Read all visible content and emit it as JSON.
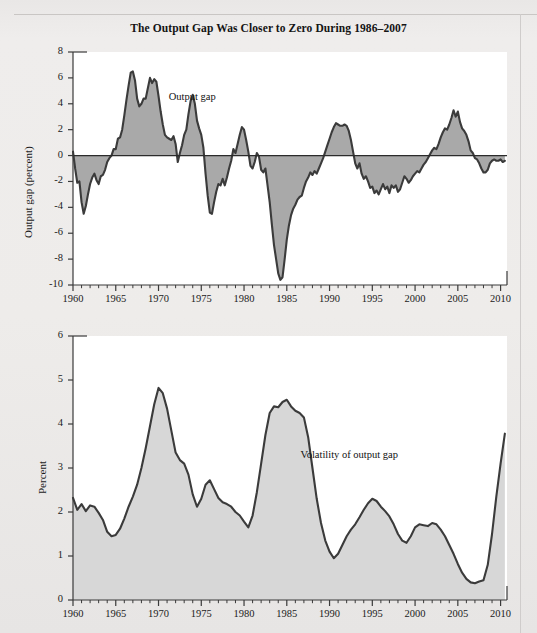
{
  "figure": {
    "title": "The Output Gap Was Closer to Zero During 1986–2007",
    "background_color": "#eceaea",
    "line_color": "#3b3b3b",
    "top_fill_color": "#a9a9a9",
    "bottom_fill_color": "#d7d7d7"
  },
  "chart_data": [
    {
      "type": "area",
      "panel": "top",
      "title": "The Output Gap Was Closer to Zero During 1986–2007",
      "xlabel": "",
      "ylabel": "Output gap (percent)",
      "xlim": [
        1960,
        2010.75
      ],
      "ylim": [
        -10,
        8
      ],
      "ytick_labels": [
        "8",
        "6",
        "4",
        "2",
        "0",
        "-2",
        "-4",
        "-6",
        "-8",
        "-10"
      ],
      "ytick_values": [
        8,
        6,
        4,
        2,
        0,
        -2,
        -4,
        -6,
        -8,
        -10
      ],
      "xtick_labels": [
        "1960",
        "1965",
        "1970",
        "1975",
        "1980",
        "1985",
        "1990",
        "1995",
        "2000",
        "2005",
        "2010"
      ],
      "xtick_values": [
        1960,
        1965,
        1970,
        1975,
        1980,
        1985,
        1990,
        1995,
        2000,
        2005,
        2010
      ],
      "minor_xtick_interval": 1,
      "grid": false,
      "legend": "none",
      "annotations": [
        {
          "text": "Output gap",
          "x": 1971.2,
          "y": 4.4
        }
      ],
      "zero_line": true,
      "series": [
        {
          "name": "Output gap",
          "x": [
            1960.0,
            1960.25,
            1960.5,
            1960.75,
            1961.0,
            1961.25,
            1961.5,
            1961.75,
            1962.0,
            1962.25,
            1962.5,
            1962.75,
            1963.0,
            1963.25,
            1963.5,
            1963.75,
            1964.0,
            1964.25,
            1964.5,
            1964.75,
            1965.0,
            1965.25,
            1965.5,
            1965.75,
            1966.0,
            1966.25,
            1966.5,
            1966.75,
            1967.0,
            1967.25,
            1967.5,
            1967.75,
            1968.0,
            1968.25,
            1968.5,
            1968.75,
            1969.0,
            1969.25,
            1969.5,
            1969.75,
            1970.0,
            1970.25,
            1970.5,
            1970.75,
            1971.0,
            1971.25,
            1971.5,
            1971.75,
            1972.0,
            1972.25,
            1972.5,
            1972.75,
            1973.0,
            1973.25,
            1973.5,
            1973.75,
            1974.0,
            1974.25,
            1974.5,
            1974.75,
            1975.0,
            1975.25,
            1975.5,
            1975.75,
            1976.0,
            1976.25,
            1976.5,
            1976.75,
            1977.0,
            1977.25,
            1977.5,
            1977.75,
            1978.0,
            1978.25,
            1978.5,
            1978.75,
            1979.0,
            1979.25,
            1979.5,
            1979.75,
            1980.0,
            1980.25,
            1980.5,
            1980.75,
            1981.0,
            1981.25,
            1981.5,
            1981.75,
            1982.0,
            1982.25,
            1982.5,
            1982.75,
            1983.0,
            1983.25,
            1983.5,
            1983.75,
            1984.0,
            1984.25,
            1984.5,
            1984.75,
            1985.0,
            1985.25,
            1985.5,
            1985.75,
            1986.0,
            1986.25,
            1986.5,
            1986.75,
            1987.0,
            1987.25,
            1987.5,
            1987.75,
            1988.0,
            1988.25,
            1988.5,
            1988.75,
            1989.0,
            1989.25,
            1989.5,
            1989.75,
            1990.0,
            1990.25,
            1990.5,
            1990.75,
            1991.0,
            1991.25,
            1991.5,
            1991.75,
            1992.0,
            1992.25,
            1992.5,
            1992.75,
            1993.0,
            1993.25,
            1993.5,
            1993.75,
            1994.0,
            1994.25,
            1994.5,
            1994.75,
            1995.0,
            1995.25,
            1995.5,
            1995.75,
            1996.0,
            1996.25,
            1996.5,
            1996.75,
            1997.0,
            1997.25,
            1997.5,
            1997.75,
            1998.0,
            1998.25,
            1998.5,
            1998.75,
            1999.0,
            1999.25,
            1999.5,
            1999.75,
            2000.0,
            2000.25,
            2000.5,
            2000.75,
            2001.0,
            2001.25,
            2001.5,
            2001.75,
            2002.0,
            2002.25,
            2002.5,
            2002.75,
            2003.0,
            2003.25,
            2003.5,
            2003.75,
            2004.0,
            2004.25,
            2004.5,
            2004.75,
            2005.0,
            2005.25,
            2005.5,
            2005.75,
            2006.0,
            2006.25,
            2006.5,
            2006.75,
            2007.0,
            2007.25,
            2007.5,
            2007.75,
            2008.0,
            2008.25,
            2008.5,
            2008.75,
            2009.0,
            2009.25,
            2009.5,
            2009.75,
            2010.0,
            2010.25,
            2010.5
          ],
          "y": [
            0.3,
            -1.0,
            -2.1,
            -2.0,
            -3.6,
            -4.5,
            -3.9,
            -3.0,
            -2.2,
            -1.7,
            -1.4,
            -1.9,
            -2.2,
            -1.6,
            -1.5,
            -1.1,
            -0.5,
            -0.2,
            0.0,
            0.5,
            0.5,
            1.3,
            1.4,
            2.0,
            3.1,
            4.3,
            5.4,
            6.4,
            6.5,
            5.8,
            4.4,
            3.8,
            4.0,
            4.4,
            4.4,
            5.2,
            6.0,
            5.6,
            5.9,
            5.7,
            4.6,
            3.4,
            2.4,
            1.6,
            1.4,
            1.3,
            1.2,
            1.5,
            0.9,
            -0.5,
            0.2,
            0.8,
            1.6,
            2.0,
            3.2,
            4.2,
            4.7,
            4.0,
            2.7,
            2.1,
            1.6,
            0.6,
            -1.4,
            -3.1,
            -4.4,
            -4.5,
            -3.6,
            -2.8,
            -2.2,
            -2.3,
            -1.8,
            -2.3,
            -1.7,
            -1.0,
            -0.4,
            0.5,
            0.2,
            0.9,
            1.6,
            2.2,
            2.0,
            1.2,
            0.3,
            -0.8,
            -1.0,
            -0.5,
            0.2,
            -0.1,
            -1.1,
            -1.3,
            -1.0,
            -2.3,
            -3.6,
            -5.3,
            -6.9,
            -8.0,
            -9.1,
            -9.6,
            -9.4,
            -8.0,
            -6.5,
            -5.4,
            -4.6,
            -4.1,
            -3.8,
            -3.4,
            -3.2,
            -3.1,
            -2.5,
            -2.0,
            -1.7,
            -1.3,
            -1.5,
            -1.2,
            -1.4,
            -1.0,
            -0.6,
            -0.2,
            0.3,
            0.8,
            1.3,
            1.8,
            2.2,
            2.5,
            2.4,
            2.3,
            2.3,
            2.4,
            2.3,
            1.9,
            1.2,
            0.3,
            -0.6,
            -1.0,
            -0.6,
            -1.4,
            -1.8,
            -1.6,
            -2.0,
            -2.5,
            -2.4,
            -2.9,
            -2.7,
            -3.0,
            -2.6,
            -2.2,
            -2.6,
            -2.4,
            -2.9,
            -2.3,
            -2.5,
            -2.3,
            -2.8,
            -2.6,
            -2.1,
            -1.6,
            -1.8,
            -2.1,
            -1.9,
            -1.6,
            -1.4,
            -1.2,
            -1.3,
            -1.0,
            -0.7,
            -0.5,
            -0.2,
            0.1,
            0.4,
            0.6,
            0.5,
            0.9,
            1.4,
            1.8,
            2.1,
            2.0,
            2.4,
            2.9,
            3.5,
            3.0,
            3.4,
            2.6,
            2.1,
            1.9,
            1.6,
            1.1,
            0.4,
            0.2,
            -0.2,
            -0.3,
            -0.6,
            -1.0,
            -1.3,
            -1.3,
            -1.1,
            -0.6,
            -0.4,
            -0.3,
            -0.4,
            -0.4,
            -0.3,
            -0.5,
            -0.4,
            -0.3,
            0.1,
            0.4,
            0.0,
            0.3,
            0.8,
            0.5,
            0.1,
            -0.1,
            -0.2,
            -0.2,
            -0.3,
            -0.4,
            -0.5,
            -0.5,
            -0.5,
            -0.4,
            -0.6,
            -1.6,
            -3.8,
            -6.2,
            -8.2,
            -9.3,
            -9.7,
            -9.2,
            -9.6,
            -8.4,
            -7.9,
            -8.1
          ]
        }
      ]
    },
    {
      "type": "area",
      "panel": "bottom",
      "title": "",
      "xlabel": "",
      "ylabel": "Percent",
      "xlim": [
        1960,
        2010.75
      ],
      "ylim": [
        0,
        6
      ],
      "ytick_labels": [
        "6",
        "5",
        "4",
        "3",
        "2",
        "1",
        "0"
      ],
      "ytick_values": [
        6,
        5,
        4,
        3,
        2,
        1,
        0
      ],
      "xtick_labels": [
        "1960",
        "1965",
        "1970",
        "1975",
        "1980",
        "1985",
        "1990",
        "1995",
        "2000",
        "2005",
        "2010"
      ],
      "xtick_values": [
        1960,
        1965,
        1970,
        1975,
        1980,
        1985,
        1990,
        1995,
        2000,
        2005,
        2010
      ],
      "minor_xtick_interval": 1,
      "grid": false,
      "legend": "none",
      "annotations": [
        {
          "text": "Volatility of output gap",
          "x": 1986.6,
          "y": 3.25
        }
      ],
      "zero_line": false,
      "series": [
        {
          "name": "Volatility of output gap",
          "x": [
            1960.0,
            1960.5,
            1961.0,
            1961.5,
            1962.0,
            1962.5,
            1963.0,
            1963.5,
            1964.0,
            1964.5,
            1965.0,
            1965.5,
            1966.0,
            1966.5,
            1967.0,
            1967.5,
            1968.0,
            1968.5,
            1969.0,
            1969.5,
            1970.0,
            1970.5,
            1971.0,
            1971.5,
            1972.0,
            1972.5,
            1973.0,
            1973.5,
            1974.0,
            1974.5,
            1975.0,
            1975.5,
            1976.0,
            1976.5,
            1977.0,
            1977.5,
            1978.0,
            1978.5,
            1979.0,
            1979.5,
            1980.0,
            1980.5,
            1981.0,
            1981.5,
            1982.0,
            1982.5,
            1983.0,
            1983.5,
            1984.0,
            1984.5,
            1985.0,
            1985.5,
            1986.0,
            1986.5,
            1987.0,
            1987.5,
            1988.0,
            1988.5,
            1989.0,
            1989.5,
            1990.0,
            1990.5,
            1991.0,
            1991.5,
            1992.0,
            1992.5,
            1993.0,
            1993.5,
            1994.0,
            1994.5,
            1995.0,
            1995.5,
            1996.0,
            1996.5,
            1997.0,
            1997.5,
            1998.0,
            1998.5,
            1999.0,
            1999.5,
            2000.0,
            2000.5,
            2001.0,
            2001.5,
            2002.0,
            2002.5,
            2003.0,
            2003.5,
            2004.0,
            2004.5,
            2005.0,
            2005.5,
            2006.0,
            2006.5,
            2007.0,
            2007.5,
            2008.0,
            2008.5,
            2009.0,
            2009.5,
            2010.0,
            2010.5
          ],
          "y": [
            2.32,
            2.05,
            2.18,
            2.02,
            2.15,
            2.12,
            1.98,
            1.82,
            1.55,
            1.45,
            1.48,
            1.62,
            1.85,
            2.12,
            2.35,
            2.62,
            3.0,
            3.45,
            3.95,
            4.45,
            4.82,
            4.7,
            4.35,
            3.85,
            3.35,
            3.18,
            3.1,
            2.85,
            2.4,
            2.12,
            2.3,
            2.62,
            2.72,
            2.52,
            2.32,
            2.22,
            2.18,
            2.12,
            2.0,
            1.92,
            1.78,
            1.65,
            1.92,
            2.45,
            3.1,
            3.75,
            4.25,
            4.4,
            4.38,
            4.5,
            4.55,
            4.4,
            4.3,
            4.25,
            4.15,
            3.7,
            3.0,
            2.3,
            1.75,
            1.35,
            1.1,
            0.95,
            1.05,
            1.25,
            1.45,
            1.6,
            1.72,
            1.88,
            2.05,
            2.2,
            2.3,
            2.25,
            2.12,
            2.02,
            1.9,
            1.72,
            1.5,
            1.35,
            1.3,
            1.45,
            1.65,
            1.72,
            1.7,
            1.68,
            1.75,
            1.72,
            1.6,
            1.45,
            1.25,
            1.05,
            0.82,
            0.62,
            0.48,
            0.4,
            0.38,
            0.42,
            0.45,
            0.8,
            1.5,
            2.35,
            3.1,
            3.78
          ]
        }
      ]
    }
  ]
}
